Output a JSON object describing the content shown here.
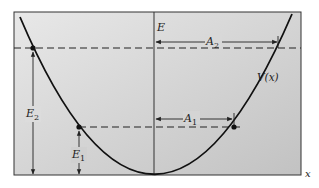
{
  "diagram": {
    "labels": {
      "energy_axis": "E",
      "position_axis": "x",
      "potential": "V(x)",
      "amplitude_high": "A",
      "amplitude_high_sub": "2",
      "amplitude_low": "A",
      "amplitude_low_sub": "1",
      "energy_high": "E",
      "energy_high_sub": "2",
      "energy_low": "E",
      "energy_low_sub": "1"
    },
    "colors": {
      "background_light": "#e6e6e6",
      "background_dark": "#c4c4c4",
      "frame": "#333333",
      "curve": "#111111",
      "dashes": "#222222"
    }
  }
}
